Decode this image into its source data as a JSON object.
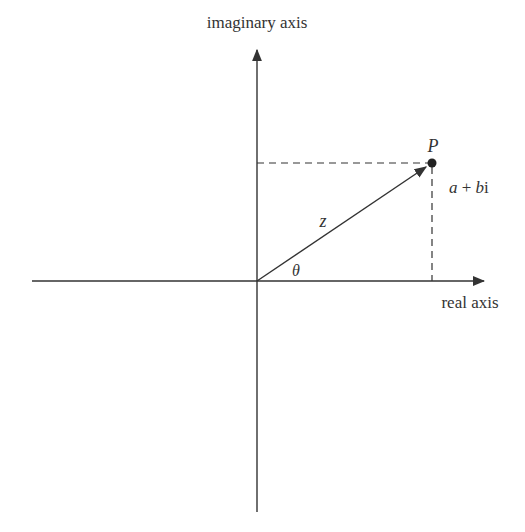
{
  "diagram": {
    "labels": {
      "imaginary_axis": "imaginary axis",
      "real_axis": "real axis",
      "point": "P",
      "complex_number": "a + bi",
      "complex_a": "a",
      "complex_plus": " + ",
      "complex_b": "b",
      "complex_i": "i",
      "modulus": "z",
      "angle": "θ"
    },
    "geometry": {
      "origin": [
        257,
        281
      ],
      "point_p": [
        432,
        163
      ],
      "real_axis_range": [
        32,
        486
      ],
      "imaginary_axis_range": [
        48,
        512
      ]
    },
    "colors": {
      "line": "#333333",
      "text": "#333333",
      "background": "#ffffff"
    }
  }
}
